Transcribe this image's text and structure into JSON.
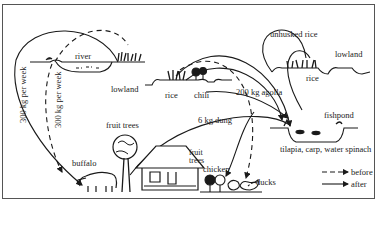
{
  "labels": {
    "river": "river",
    "lowland_left": "lowland",
    "rice_left": "rice",
    "chili": "chili",
    "agolla": "200 kg agolla",
    "unhusked_rice": "unhusked rice",
    "lowland_right": "lowland",
    "rice_right": "rice",
    "fishpond": "fishpond",
    "fishpond_species": "tilapia, carp, water spinach",
    "dung": "6 kg dung",
    "fruit_trees_left": "fruit trees",
    "fruit_trees_right_1": "fruit",
    "fruit_trees_right_2": "trees",
    "buffalo": "buffalo",
    "chicken": "chicken",
    "ducks": "ducks",
    "flow_solid_vertical": "300 kg per week",
    "flow_dashed_vertical": "300 kg per week"
  },
  "legend": {
    "before": "before",
    "after": "after"
  },
  "colors": {
    "ink": "#1a1a1a",
    "frame": "#555555",
    "background": "#ffffff"
  }
}
